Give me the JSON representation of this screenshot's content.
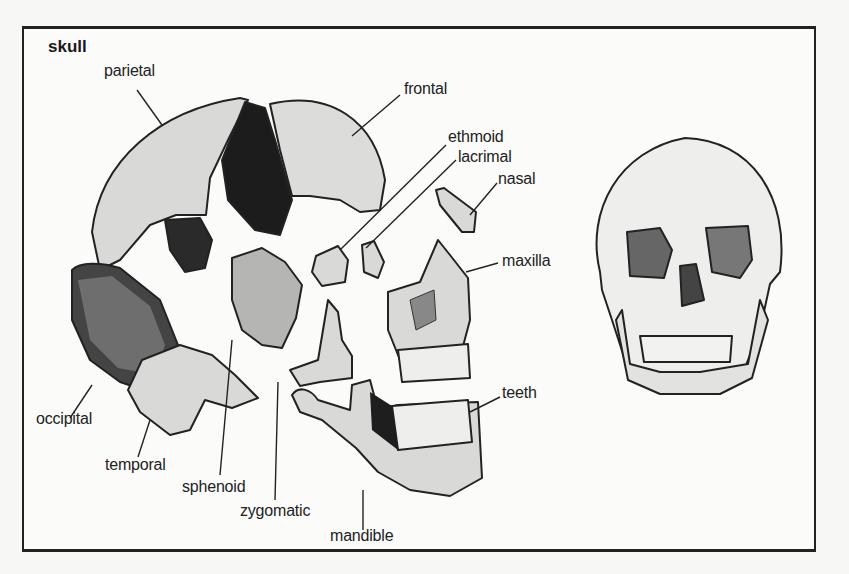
{
  "diagram": {
    "title": "skull",
    "labels": {
      "parietal": "parietal",
      "frontal": "frontal",
      "ethmoid": "ethmoid",
      "lacrimal": "lacrimal",
      "nasal": "nasal",
      "maxilla": "maxilla",
      "teeth": "teeth",
      "occipital": "occipital",
      "temporal": "temporal",
      "sphenoid": "sphenoid",
      "zygomatic": "zygomatic",
      "mandible": "mandible"
    },
    "views": [
      "exploded-lateral-view",
      "anterior-view"
    ],
    "colors": {
      "ink": "#222222",
      "bone": "#d8d8d6",
      "shadow": "#1a1a1a",
      "paper": "#fbfbfa"
    }
  }
}
